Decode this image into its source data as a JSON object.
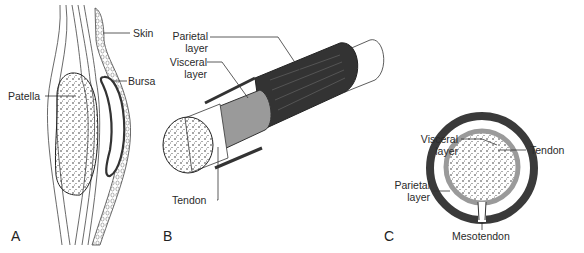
{
  "figure": {
    "panels": [
      {
        "id": "A",
        "label": "A",
        "callouts": {
          "skin": "Skin",
          "bursa": "Bursa",
          "patella": "Patella"
        }
      },
      {
        "id": "B",
        "label": "B",
        "callouts": {
          "parietal_1": "Parietal",
          "parietal_2": "layer",
          "visceral_1": "Visceral",
          "visceral_2": "layer",
          "tendon": "Tendon"
        }
      },
      {
        "id": "C",
        "label": "C",
        "callouts": {
          "visceral_1": "Visceral",
          "visceral_2": "layer",
          "parietal_1": "Parietal",
          "parietal_2": "layer",
          "tendon": "Tendon",
          "mesotendon": "Mesotendon"
        }
      }
    ],
    "colors": {
      "parietal": "#3a3a3a",
      "visceral": "#9a9a9a",
      "line": "#333333",
      "background": "#ffffff"
    }
  }
}
